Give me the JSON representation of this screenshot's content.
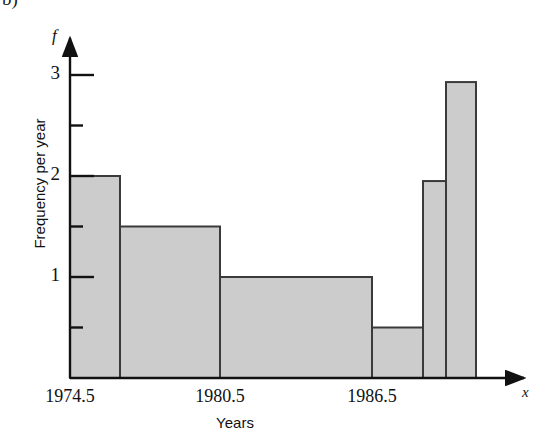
{
  "figure": {
    "corner_fragment": "b)"
  },
  "chart_data": {
    "type": "bar",
    "title": "",
    "subtitle": "",
    "xlabel": "Years",
    "ylabel": "Frequency per year",
    "x_axis_symbol": "x",
    "y_axis_symbol": "f",
    "grid": false,
    "legend": null,
    "xlim": [
      1974.5,
      1992.5
    ],
    "ylim": [
      0,
      3.35
    ],
    "x_tick_labels": [
      "1974.5",
      "1980.5",
      "1986.5"
    ],
    "x_tick_values": [
      1974.5,
      1980.5,
      1986.5
    ],
    "y_tick_labels": [
      "1",
      "2",
      "3"
    ],
    "y_tick_values": [
      1,
      2,
      3
    ],
    "y_minor_tick_values": [
      0.5,
      1.5,
      2.5
    ],
    "bar_style": {
      "fill": "#cccccc",
      "stroke": "#3a3a3a",
      "stroke_width": 2
    },
    "axis_color": "#111111",
    "bins": [
      {
        "label": "1974.5-1976.5",
        "x_start": 1974.5,
        "x_end": 1976.5,
        "value": 2.0
      },
      {
        "label": "1976.5-1980.5",
        "x_start": 1976.5,
        "x_end": 1980.5,
        "value": 1.5
      },
      {
        "label": "1980.5-1986.5",
        "x_start": 1980.5,
        "x_end": 1986.5,
        "value": 1.0
      },
      {
        "label": "1986.5-1988.5",
        "x_start": 1986.5,
        "x_end": 1988.5,
        "value": 0.5
      },
      {
        "label": "1988.5-1989.5",
        "x_start": 1988.5,
        "x_end": 1989.5,
        "value": 1.95
      },
      {
        "label": "1989.5-1990.5",
        "x_start": 1989.5,
        "x_end": 1990.5,
        "value": 2.93
      }
    ],
    "categories": [
      "1974.5-1976.5",
      "1976.5-1980.5",
      "1980.5-1986.5",
      "1986.5-1988.5",
      "1988.5-1989.5",
      "1989.5-1990.5"
    ],
    "values": [
      2.0,
      1.5,
      1.0,
      0.5,
      1.95,
      2.93
    ]
  },
  "geometry": {
    "axis_x_px": 70,
    "baseline_y_px": 378,
    "unit_px": 101,
    "bar_edges_px": [
      70,
      120,
      220,
      372,
      423,
      446,
      476
    ],
    "y_tick_px": {
      "one": 277,
      "two": 176,
      "three": 75
    },
    "y_minor_tick_px": {
      "half": 328,
      "onehalf": 227,
      "twohalf": 126
    },
    "x_tick_px": [
      70,
      220,
      372
    ]
  }
}
